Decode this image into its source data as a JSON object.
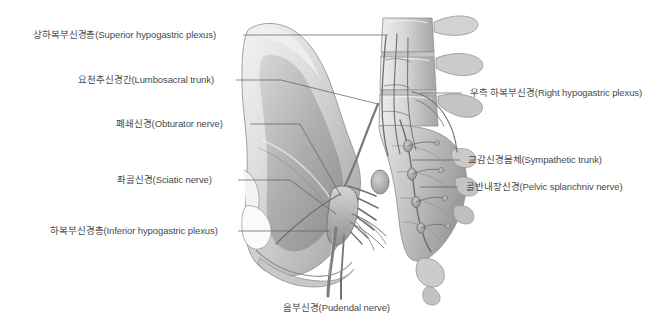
{
  "figure": {
    "style": "grayscale medical illustration",
    "background_color": "#ffffff",
    "label_text_color": "#4a4a4a",
    "leader_line_color": "#5a5a5a"
  },
  "labels": {
    "superior_hypogastric_plexus": "상하복부신경총(Superior hypogastric plexus)",
    "lumbosacral_trunk": "요천추신경간(Lumbosacral trunk)",
    "obturator_nerve": "폐쇄신경(Obturator nerve)",
    "sciatic_nerve": "좌골신경(Sciatic nerve)",
    "inferior_hypogastric_plexus": "하복부신경총(Inferior hypogastric plexus)",
    "right_hypogastric_plexus": "우측 하복부신경(Right hypogastric plexus)",
    "sympathetic_trunk": "교감신경몸체(Sympathetic trunk)",
    "pelvic_splanchnic_nerve": "골반내장신경(Pelvic splanchniv nerve)",
    "pudendal_nerve": "음부신경(Pudendal nerve)"
  }
}
